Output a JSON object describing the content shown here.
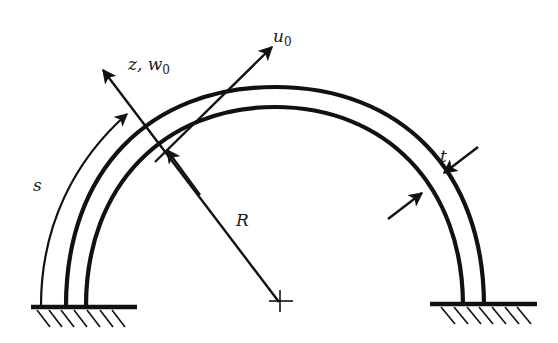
{
  "figure": {
    "type": "curved-beam-arch-diagram",
    "colors": {
      "stroke": "#111111",
      "background": "#ffffff"
    }
  },
  "labels": {
    "tangential_displacement": {
      "symbol": "u",
      "subscript": "0"
    },
    "normal_axis": {
      "prefix": "z, ",
      "symbol": "w",
      "subscript": "0"
    },
    "arc_length": "s",
    "radius": "R",
    "thickness": "t"
  },
  "supports": [
    {
      "name": "left-fixed-support",
      "hatch_count": 7
    },
    {
      "name": "right-fixed-support",
      "hatch_count": 7
    }
  ],
  "center_marker": "crosshair"
}
